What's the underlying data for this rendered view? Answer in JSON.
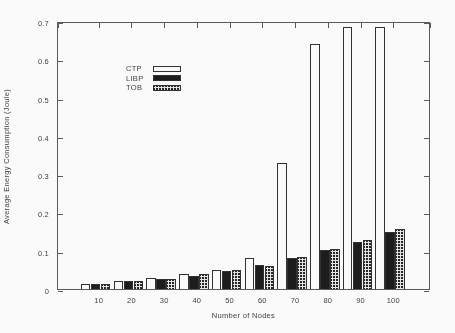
{
  "chart_data": {
    "type": "bar",
    "title": "",
    "xlabel": "Number of Nodes",
    "ylabel": "Average Energy Consumption (Joule)",
    "categories": [
      "10",
      "20",
      "30",
      "40",
      "50",
      "60",
      "70",
      "80",
      "90",
      "100"
    ],
    "series": [
      {
        "name": "CTP",
        "style": "white",
        "values": [
          0.013,
          0.021,
          0.029,
          0.04,
          0.049,
          0.08,
          0.33,
          0.64,
          0.685,
          0.685
        ]
      },
      {
        "name": "LIBP",
        "style": "black",
        "values": [
          0.013,
          0.02,
          0.026,
          0.034,
          0.046,
          0.063,
          0.081,
          0.102,
          0.123,
          0.15
        ]
      },
      {
        "name": "TOB",
        "style": "hatched",
        "values": [
          0.014,
          0.021,
          0.027,
          0.039,
          0.049,
          0.061,
          0.084,
          0.105,
          0.128,
          0.156
        ]
      }
    ],
    "ylim": [
      0,
      0.7
    ],
    "ytick_labels": [
      "0",
      "0.1",
      "0.2",
      "0.3",
      "0.4",
      "0.5",
      "0.6",
      "0.7"
    ],
    "ytick_values": [
      0,
      0.1,
      0.2,
      0.3,
      0.4,
      0.5,
      0.6,
      0.7
    ],
    "grid": false,
    "legend_position": "top-left",
    "legend": [
      {
        "label": "CTP",
        "swatch": "white-bar-swatch"
      },
      {
        "label": "LIBP",
        "swatch": "black-bar-swatch"
      },
      {
        "label": "TOB",
        "swatch": "hatched-bar-swatch"
      }
    ],
    "colors": {
      "ctp": "#ffffff",
      "libp": "#141414",
      "tob": "#e8e8e8",
      "axis": "#555555",
      "bar_outline": "#2a2a2a"
    }
  }
}
